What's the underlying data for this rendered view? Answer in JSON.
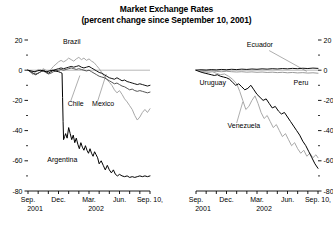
{
  "title": {
    "line1": "Market Exchange Rates",
    "line2": "(percent change since September 10, 2001)"
  },
  "chart_data": {
    "type": "line",
    "title": "Market Exchange Rates (percent change since September 10, 2001)",
    "xlabel": "",
    "ylabel": "",
    "ylim": [
      -80,
      20
    ],
    "yticks": [
      20,
      0,
      -20,
      -40,
      -60,
      -80
    ],
    "ytick_labels": [
      "20",
      "0",
      "-20",
      "-40",
      "-60",
      "-80"
    ],
    "minor_yticks": [
      10,
      -10,
      -30,
      -50,
      -70
    ],
    "grid": false,
    "zero_line": true,
    "legend": "inline-annotations",
    "xlim": [
      0,
      12
    ],
    "xticks": [
      0,
      1,
      2,
      3,
      4,
      5,
      6,
      7,
      8,
      9,
      10,
      11,
      12
    ],
    "xtick_labels": [
      "Sep.",
      "",
      "",
      "Dec.",
      "",
      "",
      "Mar.",
      "",
      "",
      "Jun.",
      "",
      "",
      "Sep. 10,"
    ],
    "xtick_year_labels": [
      {
        "at": 0,
        "text": "2001"
      },
      {
        "at": 6,
        "text": "2002"
      }
    ],
    "panels": [
      {
        "name": "left-panel",
        "axis_left": true,
        "axis_right": false,
        "series": [
          {
            "name": "Brazil",
            "color": "#a8a8a8",
            "label_x": 3.45,
            "label_y": 17.5,
            "leader": null,
            "x": [
              0,
              0.25,
              0.5,
              0.75,
              1,
              1.25,
              1.5,
              1.75,
              2,
              2.25,
              2.5,
              2.75,
              3,
              3.25,
              3.5,
              3.75,
              4,
              4.25,
              4.5,
              4.75,
              5,
              5.25,
              5.5,
              5.75,
              6,
              6.25,
              6.5,
              6.75,
              7,
              7.25,
              7.5,
              7.75,
              8,
              8.25,
              8.5,
              8.75,
              9,
              9.25,
              9.5,
              9.75,
              10,
              10.25,
              10.5,
              10.75,
              11,
              11.25,
              11.5,
              11.75,
              12
            ],
            "y": [
              0,
              -1.5,
              -3,
              -1,
              0.5,
              -0.5,
              1,
              0,
              -1,
              0.5,
              2.5,
              4,
              5.5,
              6.5,
              5.5,
              6.5,
              8,
              7,
              6,
              7.5,
              8.5,
              7,
              8,
              6.5,
              7.5,
              6,
              5,
              3,
              1,
              -1.5,
              -4,
              -6,
              -8,
              -10,
              -13,
              -15,
              -13.5,
              -16,
              -19,
              -21,
              -23.5,
              -26,
              -30,
              -33,
              -31,
              -28,
              -26,
              -28,
              -25.5
            ]
          },
          {
            "name": "Mexico",
            "color": "#111111",
            "label_x": 6.3,
            "label_y": -23.5,
            "leader": {
              "x1": 6.85,
              "y1": -20.5,
              "x2": 7.7,
              "y2": -2.5
            },
            "x": [
              0,
              0.25,
              0.5,
              0.75,
              1,
              1.25,
              1.5,
              1.75,
              2,
              2.25,
              2.5,
              2.75,
              3,
              3.25,
              3.5,
              3.75,
              4,
              4.25,
              4.5,
              4.75,
              5,
              5.25,
              5.5,
              5.75,
              6,
              6.25,
              6.5,
              6.75,
              7,
              7.25,
              7.5,
              7.75,
              8,
              8.25,
              8.5,
              8.75,
              9,
              9.25,
              9.5,
              9.75,
              10,
              10.25,
              10.5,
              10.75,
              11,
              11.25,
              11.5,
              11.75,
              12
            ],
            "y": [
              0,
              -1,
              -2,
              -3,
              -2,
              -1,
              0,
              -1,
              -2,
              -1,
              0,
              0.5,
              1,
              1.5,
              1,
              1.5,
              2,
              2.5,
              2,
              2.5,
              3,
              2,
              1.5,
              2,
              2.5,
              1.5,
              0.5,
              -0.5,
              -1.5,
              -2,
              -3,
              -4,
              -5,
              -5.5,
              -6,
              -5,
              -6,
              -7,
              -6.5,
              -7.5,
              -8,
              -8.5,
              -9,
              -9.5,
              -9,
              -9.5,
              -10,
              -10.5,
              -10
            ]
          },
          {
            "name": "Chile",
            "color": "#555555",
            "label_x": 3.9,
            "label_y": -23.5,
            "leader": {
              "x1": 4.2,
              "y1": -20.5,
              "x2": 5.1,
              "y2": -3.5
            },
            "x": [
              0,
              0.25,
              0.5,
              0.75,
              1,
              1.25,
              1.5,
              1.75,
              2,
              2.25,
              2.5,
              2.75,
              3,
              3.25,
              3.5,
              3.75,
              4,
              4.25,
              4.5,
              4.75,
              5,
              5.25,
              5.5,
              5.75,
              6,
              6.25,
              6.5,
              6.75,
              7,
              7.25,
              7.5,
              7.75,
              8,
              8.25,
              8.5,
              8.75,
              9,
              9.25,
              9.5,
              9.75,
              10,
              10.25,
              10.5,
              10.75,
              11,
              11.25,
              11.5,
              11.75,
              12
            ],
            "y": [
              0,
              -1,
              -2,
              -2.5,
              -2,
              -1,
              -0.5,
              -1.5,
              -2.5,
              -2,
              -1,
              -0.5,
              0,
              0.5,
              0,
              0.5,
              1,
              1.5,
              1,
              0.5,
              1,
              0.5,
              0,
              -0.5,
              0,
              -1,
              -2,
              -3,
              -4,
              -4.5,
              -5,
              -6,
              -7,
              -8,
              -9,
              -8.5,
              -9.5,
              -10.5,
              -11,
              -12,
              -13,
              -12.5,
              -13.5,
              -14,
              -13.5,
              -14,
              -14.5,
              -15,
              -14.5
            ]
          },
          {
            "name": "Argentina",
            "color": "#000000",
            "label_x": 1.9,
            "label_y": -61,
            "leader": null,
            "x": [
              0,
              0.3,
              0.6,
              0.9,
              1.2,
              1.5,
              1.8,
              2.1,
              2.4,
              2.7,
              3,
              3.2,
              3.35,
              3.4,
              3.45,
              3.5,
              3.6,
              3.7,
              3.85,
              4,
              4.15,
              4.3,
              4.45,
              4.6,
              4.75,
              4.9,
              5.05,
              5.2,
              5.35,
              5.5,
              5.65,
              5.8,
              5.95,
              6.1,
              6.25,
              6.4,
              6.55,
              6.7,
              6.85,
              7,
              7.2,
              7.4,
              7.6,
              7.8,
              8,
              8.2,
              8.4,
              8.6,
              8.8,
              9,
              9.25,
              9.5,
              9.75,
              10,
              10.25,
              10.5,
              10.75,
              11,
              11.25,
              11.5,
              11.75,
              12
            ],
            "y": [
              0,
              -0.5,
              -1,
              -0.5,
              0,
              -0.5,
              -1,
              -0.5,
              0,
              -0.5,
              -1,
              -1.5,
              -2,
              -18,
              -34,
              -46,
              -44,
              -42,
              -45,
              -38,
              -42,
              -46,
              -43,
              -48,
              -45,
              -49,
              -52,
              -48,
              -51,
              -53,
              -50,
              -53,
              -55,
              -52,
              -55,
              -57,
              -54,
              -56,
              -58,
              -62,
              -60,
              -63,
              -66,
              -63,
              -66,
              -68,
              -66,
              -69,
              -70,
              -69,
              -70,
              -70.5,
              -70,
              -71,
              -70.5,
              -71,
              -70.5,
              -70,
              -70.5,
              -70,
              -70.5,
              -70
            ]
          }
        ]
      },
      {
        "name": "right-panel",
        "axis_left": false,
        "axis_right": true,
        "series": [
          {
            "name": "Ecuador",
            "color": "#9a9a9a",
            "label_x": 5.0,
            "label_y": 15.5,
            "leader": {
              "x1": 7.2,
              "y1": 13.0,
              "x2": 10.9,
              "y2": -0.8
            },
            "x": [
              0,
              0.5,
              1,
              1.5,
              2,
              2.5,
              3,
              3.5,
              4,
              4.5,
              5,
              5.5,
              6,
              6.5,
              7,
              7.5,
              8,
              8.5,
              9,
              9.5,
              10,
              10.5,
              11,
              11.5,
              12
            ],
            "y": [
              0,
              -0.3,
              -0.6,
              -0.4,
              -0.8,
              -1,
              -0.7,
              -1,
              -1.2,
              -1,
              -1.3,
              -1.1,
              -1.4,
              -1.2,
              -1.5,
              -1.3,
              -1.6,
              -1.4,
              -1.7,
              -1.5,
              -1.8,
              -1.6,
              -1.9,
              -1.7,
              -2
            ]
          },
          {
            "name": "Peru",
            "color": "#111111",
            "label_x": 9.6,
            "label_y": -9.5,
            "leader": null,
            "x": [
              0,
              0.5,
              1,
              1.5,
              2,
              2.5,
              3,
              3.5,
              4,
              4.5,
              5,
              5.5,
              6,
              6.5,
              7,
              7.5,
              8,
              8.5,
              9,
              9.5,
              10,
              10.5,
              11,
              11.5,
              12
            ],
            "y": [
              0,
              0.3,
              0.1,
              0.4,
              0.2,
              0.5,
              0.3,
              0.6,
              0.4,
              0.7,
              0.5,
              0.8,
              0.6,
              0.9,
              0.7,
              1,
              0.8,
              1.1,
              0.9,
              1.2,
              1,
              1.3,
              1.1,
              1.4,
              1.2
            ]
          },
          {
            "name": "Venezuela",
            "color": "#a8a8a8",
            "label_x": 3.1,
            "label_y": -38,
            "leader": {
              "x1": 4.0,
              "y1": -35,
              "x2": 4.6,
              "y2": -21
            },
            "x": [
              0,
              0.4,
              0.8,
              1.2,
              1.6,
              2,
              2.4,
              2.8,
              3.2,
              3.6,
              4,
              4.3,
              4.6,
              4.9,
              5.2,
              5.5,
              5.8,
              6.1,
              6.4,
              6.7,
              7,
              7.3,
              7.6,
              7.9,
              8.2,
              8.5,
              8.8,
              9.1,
              9.4,
              9.7,
              10,
              10.3,
              10.6,
              10.9,
              11.2,
              11.5,
              11.8,
              12
            ],
            "y": [
              0,
              -0.5,
              -1,
              -1.5,
              -1,
              -2,
              -3,
              -2.5,
              -4,
              -6,
              -9,
              -14,
              -20,
              -26,
              -24,
              -20,
              -17,
              -22,
              -28,
              -32,
              -30,
              -34,
              -38,
              -36,
              -40,
              -44,
              -42,
              -46,
              -50,
              -48,
              -52,
              -55,
              -53,
              -57,
              -55,
              -58,
              -56,
              -58
            ]
          },
          {
            "name": "Uruguay",
            "color": "#000000",
            "label_x": 0.35,
            "label_y": -9.5,
            "leader": null,
            "x": [
              0,
              0.3,
              0.6,
              0.9,
              1.2,
              1.5,
              1.8,
              2.1,
              2.4,
              2.7,
              3,
              3.3,
              3.6,
              3.9,
              4.2,
              4.5,
              4.8,
              5.1,
              5.4,
              5.7,
              6,
              6.3,
              6.6,
              6.9,
              7.2,
              7.5,
              7.8,
              8.1,
              8.4,
              8.7,
              9,
              9.3,
              9.6,
              9.9,
              10.2,
              10.5,
              10.8,
              11.1,
              11.4,
              11.7,
              12
            ],
            "y": [
              0,
              -0.8,
              -1.5,
              -2,
              -2.5,
              -3,
              -3.5,
              -3,
              -4,
              -4.5,
              -5,
              -6,
              -8,
              -10,
              -9,
              -11,
              -13,
              -12,
              -10,
              -13,
              -16,
              -18,
              -20,
              -19,
              -22,
              -25,
              -24,
              -27,
              -29,
              -28,
              -31,
              -34,
              -37,
              -40,
              -43,
              -47,
              -50,
              -54,
              -58,
              -62,
              -65
            ]
          }
        ]
      }
    ]
  }
}
